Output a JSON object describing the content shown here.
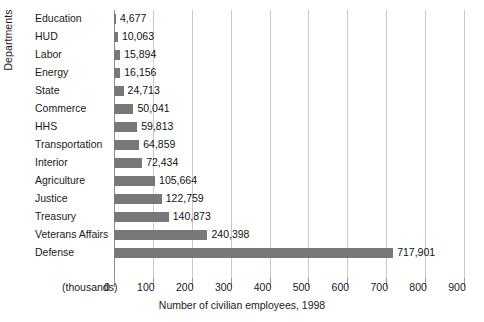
{
  "chart_data": {
    "type": "bar",
    "orientation": "horizontal",
    "title": "",
    "xlabel": "Number of civilian employees, 1998",
    "ylabel": "Departments",
    "units_note": "(thousands)",
    "xlim": [
      0,
      900
    ],
    "xticks": [
      0,
      100,
      200,
      300,
      400,
      500,
      600,
      700,
      800,
      900
    ],
    "xtick_labels": [
      "0",
      "100",
      "200",
      "300",
      "400",
      "500",
      "600",
      "700",
      "800",
      "900"
    ],
    "grid": true,
    "legend": false,
    "categories": [
      "Education",
      "HUD",
      "Labor",
      "Energy",
      "State",
      "Commerce",
      "HHS",
      "Transportation",
      "Interior",
      "Agriculture",
      "Justice",
      "Treasury",
      "Veterans Affairs",
      "Defense"
    ],
    "values": [
      4677,
      10063,
      15894,
      16156,
      24713,
      50041,
      59813,
      64859,
      72434,
      105664,
      122759,
      140873,
      240398,
      717901
    ],
    "value_labels": [
      "4,677",
      "10,063",
      "15,894",
      "16,156",
      "24,713",
      "50,041",
      "59,813",
      "64,859",
      "72,434",
      "105,664",
      "122,759",
      "140,873",
      "240,398",
      "717,901"
    ],
    "bar_color": "#787878",
    "grid_color": "#c9c9c9",
    "axis_color": "#8c8c8c",
    "background": "#ffffff"
  }
}
